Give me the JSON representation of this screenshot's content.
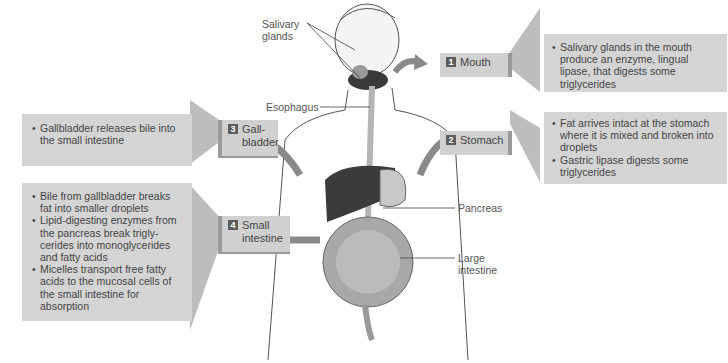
{
  "diagram": {
    "anatomy_labels": {
      "salivary_glands": "Salivary glands",
      "esophagus": "Esophagus",
      "pancreas": "Pancreas",
      "large_intestine": "Large intestine"
    },
    "steps": [
      {
        "number": "1",
        "label": "Mouth",
        "bullets": [
          "Salivary glands in the mouth produce an enzyme, lingual lipase, that digests some triglycerides"
        ]
      },
      {
        "number": "2",
        "label": "Stomach",
        "bullets": [
          "Fat arrives intact at the stomach where it is mixed and broken into droplets",
          "Gastric lipase digests some triglycerides"
        ]
      },
      {
        "number": "3",
        "label": "Gall- bladder",
        "bullets": [
          "Gallbladder releases bile into the small intestine"
        ]
      },
      {
        "number": "4",
        "label": "Small intestine",
        "bullets": [
          "Bile from gallbladder breaks fat into smaller droplets",
          "Lipid-digesting enzymes from the pancreas break trigly- cerides into monoglycerides and fatty acids",
          "Micelles transport free fatty acids to the mucosal cells of the small intestine for absorption"
        ]
      }
    ],
    "colors": {
      "box_fill": "#d4d4d4",
      "badge": "#5c5c5c",
      "arrow": "#8a8a8a"
    }
  }
}
